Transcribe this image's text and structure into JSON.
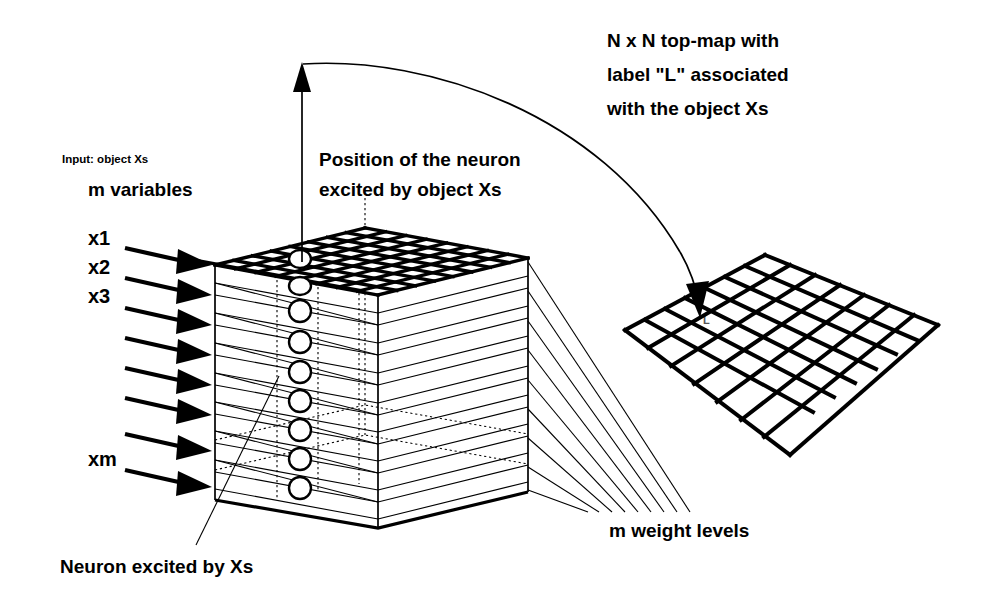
{
  "figure": {
    "type": "diagram",
    "background_color": "#ffffff",
    "ink_color": "#000000"
  },
  "labels": {
    "input_caption": "Input:  object Xs",
    "variables_caption": "m variables",
    "position_line1": "Position of the neuron",
    "position_line2": "excited by  object Xs",
    "topmap_line1": "N x N  top-map with",
    "topmap_line2": "label \"L\" associated",
    "topmap_line3": "with the object Xs",
    "weight_levels": "m  weight levels",
    "neuron_excited": "Neuron excited by Xs",
    "map_label": "L"
  },
  "inputs": {
    "arrow_count": 8,
    "visible_labels": [
      "x1",
      "x2",
      "x3",
      "xm"
    ],
    "label_rows": [
      0,
      1,
      2,
      7
    ]
  },
  "cube": {
    "layer_count": 8,
    "top_grid": {
      "rows": 8,
      "cols": 8
    },
    "neuron_column_circles": 9,
    "weight_level_lines": 8
  },
  "top_map": {
    "rows": 7,
    "cols": 7,
    "label": "L"
  },
  "colors": {
    "stroke": "#000000",
    "fill": "#ffffff",
    "label_gray": "#555555"
  }
}
